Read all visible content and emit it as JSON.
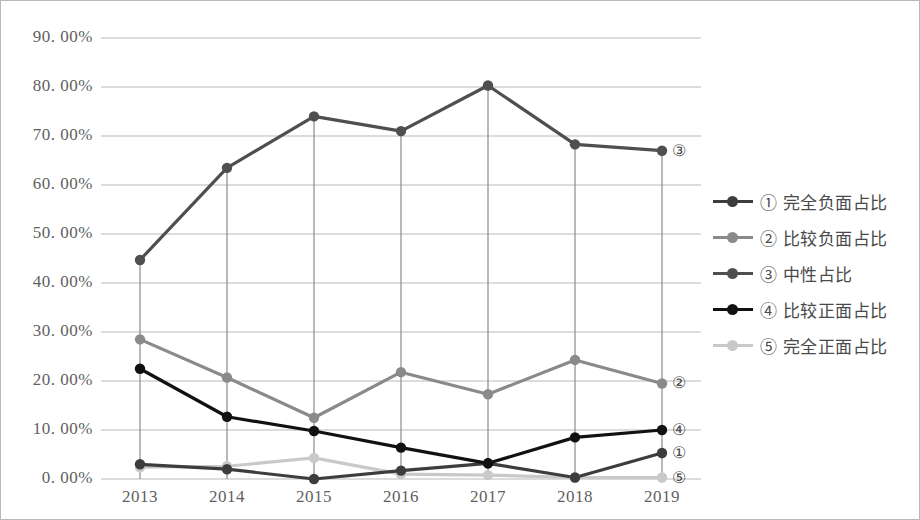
{
  "chart_data": {
    "type": "line",
    "title": "",
    "xlabel": "",
    "ylabel": "",
    "categories": [
      "2013",
      "2014",
      "2015",
      "2016",
      "2017",
      "2018",
      "2019"
    ],
    "ylim": [
      0,
      90
    ],
    "ytick_labels": [
      "90. 00%",
      "80. 00%",
      "70. 00%",
      "60. 00%",
      "50. 00%",
      "40. 00%",
      "30. 00%",
      "20. 00%",
      "10. 00%",
      "0. 00%"
    ],
    "ytick_values": [
      90,
      80,
      70,
      60,
      50,
      40,
      30,
      20,
      10,
      0
    ],
    "grid": true,
    "legend_position": "right",
    "series": [
      {
        "name": "① 完全负面占比",
        "marker": "①",
        "color": "#3d3d3d",
        "values": [
          3.0,
          2.0,
          0.0,
          1.7,
          3.2,
          0.3,
          5.3
        ]
      },
      {
        "name": "② 比较负面占比",
        "marker": "②",
        "color": "#8a8a8a",
        "values": [
          28.5,
          20.7,
          12.5,
          21.8,
          17.3,
          24.3,
          19.5
        ]
      },
      {
        "name": "③ 中性占比",
        "marker": "③",
        "color": "#4f4f4f",
        "values": [
          44.7,
          63.5,
          74.0,
          71.0,
          80.3,
          68.3,
          67.0
        ]
      },
      {
        "name": "④ 比较正面占比",
        "marker": "④",
        "color": "#111111",
        "values": [
          22.5,
          12.7,
          9.8,
          6.4,
          3.2,
          8.5,
          10.0
        ]
      },
      {
        "name": "⑤ 完全正面占比",
        "marker": "⑤",
        "color": "#c9c9c9",
        "values": [
          2.4,
          2.6,
          4.3,
          1.0,
          0.8,
          0.3,
          0.3
        ]
      }
    ],
    "endpoint_annotations": [
      {
        "label": "③",
        "series_index": 2
      },
      {
        "label": "②",
        "series_index": 1
      },
      {
        "label": "④",
        "series_index": 3
      },
      {
        "label": "①",
        "series_index": 0
      },
      {
        "label": "⑤",
        "series_index": 4
      }
    ]
  },
  "legend": {
    "items": [
      {
        "label": "① 完全负面占比"
      },
      {
        "label": "② 比较负面占比"
      },
      {
        "label": "③ 中性占比"
      },
      {
        "label": "④ 比较正面占比"
      },
      {
        "label": "⑤ 完全正面占比"
      }
    ]
  },
  "colors": {
    "gridline": "#b9b9b9",
    "border": "#b9b9b9",
    "axis_text": "#5f5f5f",
    "dropline": "#8a8a8a",
    "background": "#ffffff"
  }
}
